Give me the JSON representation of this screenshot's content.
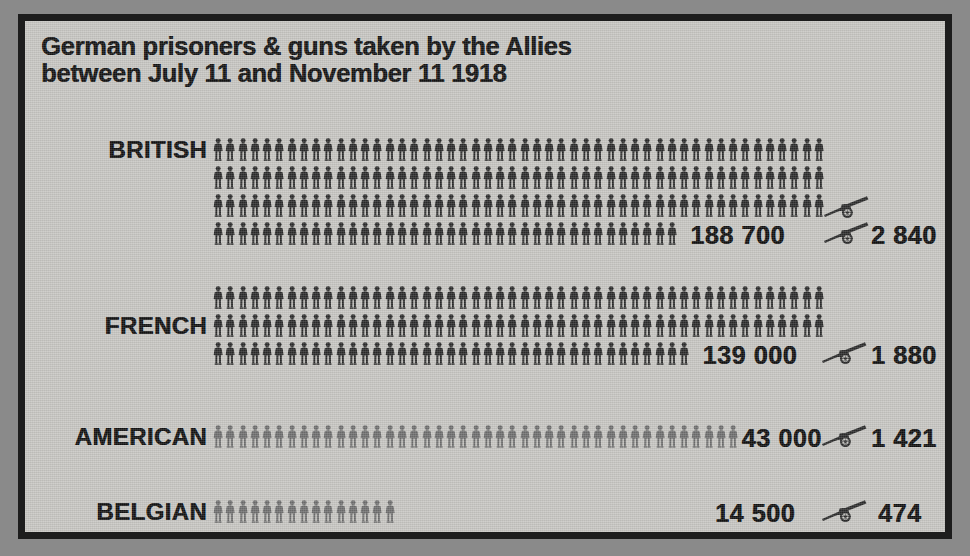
{
  "figure": {
    "title": "German prisoners & guns taken by the Allies\nbetween July 11 and November 11 1918",
    "frame_color": "#1d1d1d",
    "paper_color": "#c7c6c2",
    "ink_color": "#2b2b2b",
    "ink_color_light": "#6f6f6f",
    "prisoner_icon": "soldier-icon",
    "gun_icon": "field-gun-icon"
  },
  "chart_data": {
    "type": "pictogram",
    "title": "German prisoners & guns taken by the Allies between July 11 and November 11 1918",
    "subtitle": "",
    "xlabel": "",
    "ylabel": "",
    "unit_note_prisoners": "1 soldier symbol = 1 000 prisoners",
    "unit_note_guns": "1 field-gun symbol = 1 000 guns",
    "categories": [
      "BRITISH",
      "FRENCH",
      "AMERICAN",
      "BELGIAN"
    ],
    "series": [
      {
        "name": "prisoners",
        "values": [
          188700,
          139000,
          43000,
          14500
        ]
      },
      {
        "name": "guns",
        "values": [
          2840,
          1880,
          1421,
          474
        ]
      }
    ],
    "rows": [
      {
        "label": "BRITISH",
        "prisoners_label": "188 700",
        "prisoners_value": 188700,
        "guns_label": "2 840",
        "guns_value": 2840,
        "symbol_rows": [
          50,
          50,
          50,
          38
        ],
        "symbol_count": 188,
        "gun_symbols": 2,
        "shade": "dark"
      },
      {
        "label": "FRENCH",
        "prisoners_label": "139 000",
        "prisoners_value": 139000,
        "guns_label": "1 880",
        "guns_value": 1880,
        "symbol_rows": [
          50,
          50,
          39
        ],
        "symbol_count": 139,
        "gun_symbols": 1,
        "shade": "dark"
      },
      {
        "label": "AMERICAN",
        "prisoners_label": "43 000",
        "prisoners_value": 43000,
        "guns_label": "1 421",
        "guns_value": 1421,
        "symbol_rows": [
          43
        ],
        "symbol_count": 43,
        "gun_symbols": 1,
        "shade": "light"
      },
      {
        "label": "BELGIAN",
        "prisoners_label": "14 500",
        "prisoners_value": 14500,
        "guns_label": "474",
        "guns_value": 474,
        "symbol_rows": [
          15
        ],
        "symbol_count": 15,
        "gun_symbols": 1,
        "shade": "light"
      }
    ]
  }
}
